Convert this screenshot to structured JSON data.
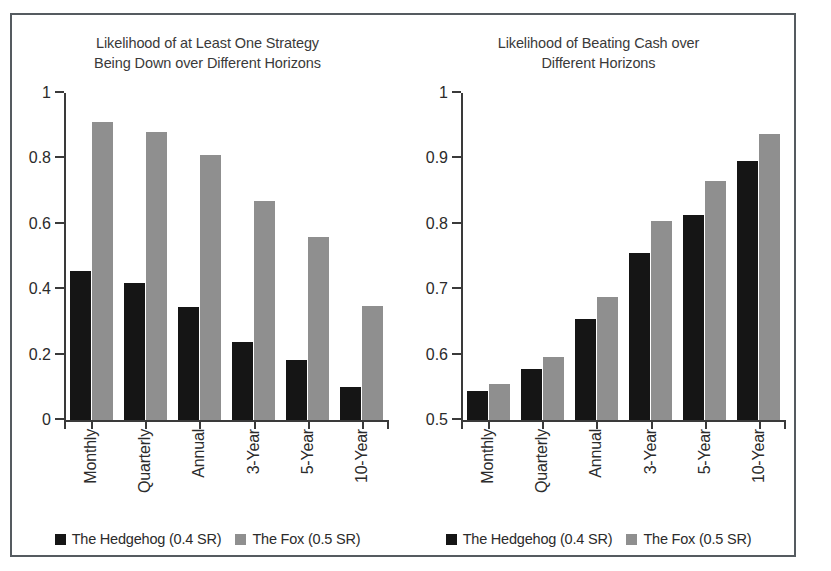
{
  "figure": {
    "frame_color": "#555b60",
    "background": "#ffffff"
  },
  "series_colors": {
    "hedgehog": "#151515",
    "fox": "#8f8f8f"
  },
  "legend": [
    {
      "label": "The Hedgehog (0.4 SR)",
      "color": "#151515"
    },
    {
      "label": "The Fox (0.5 SR)",
      "color": "#8f8f8f"
    }
  ],
  "chart_data": [
    {
      "type": "bar",
      "panel": "left",
      "title": "Likelihood of at Least One Strategy\nBeing Down over Different Horizons",
      "title_line1": "Likelihood of at Least One Strategy",
      "title_line2": "Being Down over Different Horizons",
      "xlabel": "",
      "ylabel": "",
      "categories": [
        "Monthly",
        "Quarterly",
        "Annual",
        "3-Year",
        "5-Year",
        "10-Year"
      ],
      "ylim": [
        0,
        1
      ],
      "yticks": [
        0,
        0.2,
        0.4,
        0.6,
        0.8,
        1
      ],
      "ytick_labels": [
        "0",
        "0.2",
        "0.4",
        "0.6",
        "0.8",
        "1"
      ],
      "grid": false,
      "legend_position": "bottom",
      "series": [
        {
          "name": "The Hedgehog (0.4 SR)",
          "color": "#151515",
          "values": [
            0.455,
            0.42,
            0.345,
            0.24,
            0.185,
            0.1
          ]
        },
        {
          "name": "The Fox (0.5 SR)",
          "color": "#8f8f8f",
          "values": [
            0.91,
            0.88,
            0.81,
            0.67,
            0.56,
            0.35
          ]
        }
      ]
    },
    {
      "type": "bar",
      "panel": "right",
      "title": "Likelihood of Beating Cash over\nDifferent Horizons",
      "title_line1": "Likelihood of Beating Cash over",
      "title_line2": "Different Horizons",
      "xlabel": "",
      "ylabel": "",
      "categories": [
        "Monthly",
        "Quarterly",
        "Annual",
        "3-Year",
        "5-Year",
        "10-Year"
      ],
      "ylim": [
        0.5,
        1
      ],
      "yticks": [
        0.5,
        0.6,
        0.7,
        0.8,
        0.9,
        1
      ],
      "ytick_labels": [
        "0.5",
        "0.6",
        "0.7",
        "0.8",
        "0.9",
        "1"
      ],
      "grid": false,
      "legend_position": "bottom",
      "series": [
        {
          "name": "The Hedgehog (0.4 SR)",
          "color": "#151515",
          "values": [
            0.545,
            0.578,
            0.655,
            0.755,
            0.813,
            0.896
          ]
        },
        {
          "name": "The Fox (0.5 SR)",
          "color": "#8f8f8f",
          "values": [
            0.555,
            0.597,
            0.688,
            0.805,
            0.866,
            0.938
          ]
        }
      ]
    }
  ]
}
